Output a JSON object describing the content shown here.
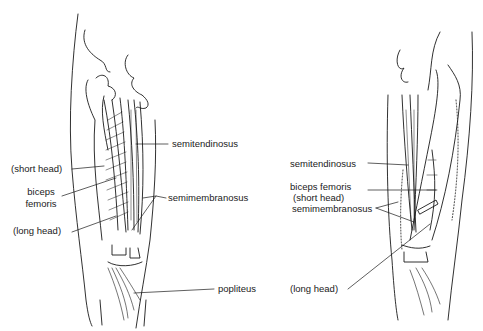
{
  "figure": {
    "left_view": {
      "labels": {
        "semitendinosus": "semitendinosus",
        "short_head": "(short head)",
        "biceps_line1": "biceps",
        "biceps_line2": "femoris",
        "semimembranosus": "semimembranosus",
        "long_head": "(long head)",
        "popliteus": "popliteus"
      }
    },
    "right_view": {
      "labels": {
        "semitendinosus": "semitendinosus",
        "biceps_line1": "biceps femoris",
        "biceps_line2": "(short head)",
        "semimembranosus": "semimembranosus",
        "long_head": "(long head)"
      }
    },
    "colors": {
      "ink": "#1a1a1a",
      "background": "#ffffff"
    }
  }
}
